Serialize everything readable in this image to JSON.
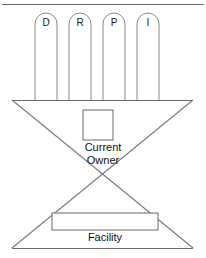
{
  "diagram": {
    "colors": {
      "line": "#6e6e6e",
      "diagonal": "#7a7a7a",
      "pillar_stroke": "#8a8a8a",
      "box_stroke": "#6a6a6a",
      "text": "#101010",
      "background": "#ffffff"
    },
    "pillars": [
      {
        "label": "D",
        "cx": 46,
        "x": 35,
        "width": 22
      },
      {
        "label": "R",
        "cx": 80,
        "x": 69,
        "width": 22
      },
      {
        "label": "P",
        "cx": 114,
        "x": 103,
        "width": 22
      },
      {
        "label": "I",
        "cx": 148,
        "x": 137,
        "width": 22
      }
    ],
    "top_rule": {
      "y": 4,
      "x1": 2,
      "x2": 204
    },
    "upper_beam": {
      "y": 100,
      "x1": 12,
      "x2": 193
    },
    "lower_beam": {
      "y": 248,
      "x1": 12,
      "x2": 193
    },
    "crossing_point": {
      "x": 103,
      "y": 174
    },
    "owner_box": {
      "label_line1": "Current",
      "label_line2": "Owner",
      "x": 83,
      "y": 110,
      "width": 30,
      "height": 30
    },
    "facility_box": {
      "label": "Facility",
      "x": 52,
      "y": 213,
      "width": 106,
      "height": 17
    }
  }
}
